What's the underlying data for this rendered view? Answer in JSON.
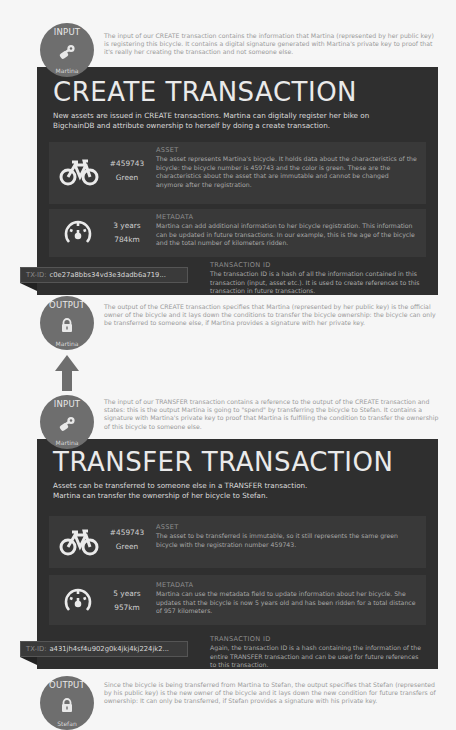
{
  "create": {
    "input": {
      "label": "INPUT",
      "owner": "Martina",
      "icon": "keys-icon",
      "text": "The input of our CREATE transaction contains the information that Martina (represented by her public key) is registering this bicycle. It contains a digital signature generated with Martina's private key to proof that it's really her creating the transaction and not someone else."
    },
    "title": "CREATE TRANSACTION",
    "subtitle": "New assets are issued in CREATE transactions. Martina can digitally register her bike on BigchainDB and attribute ownership to herself by doing a create transaction.",
    "asset": {
      "icon": "bicycle-icon",
      "value1": "#459743",
      "value2": "Green",
      "heading": "ASSET",
      "text": "The asset represents Martina's bicycle. It holds data about the characteristics of the bicycle: the bicycle number is 459743 and the color is green. These are the characteristics about the asset that are immutable and cannot be changed anymore after the registration."
    },
    "metadata": {
      "icon": "speedometer-icon",
      "value1": "3 years",
      "value2": "784km",
      "heading": "METADATA",
      "text": "Martina can add additional information to her bicycle registration. This information can be updated in future transactions. In our example, this is the age of the bicycle and the total number of kilometers ridden."
    },
    "tx": {
      "prefix": "TX-ID:",
      "id": "c0e27a8bbs34vd3e3dadb6a719...",
      "heading": "TRANSACTION ID",
      "text": "The transaction ID is a hash of all the information contained in this transaction (input, asset etc.). It is used to create references to this transaction in future transactions."
    },
    "output": {
      "label": "OUTPUT",
      "owner": "Martina",
      "icon": "lock-icon",
      "text": "The output of the CREATE transaction specifies that Martina (represented by her public key) is the official owner of the bicycle and it lays down the conditions to transfer the bicycle ownership: the bicycle can only be transferred to someone else, if Martina provides a signature with her private key."
    }
  },
  "transfer": {
    "input": {
      "label": "INPUT",
      "owner": "Martina",
      "icon": "keys-icon",
      "text": "The input of our TRANSFER transaction contains a reference to the output of the CREATE transaction and states: this is the output Martina is going to \"spend\" by transferring the bicycle to Stefan. It contains a signature with Martina's private key to proof that Martina is fulfilling the condition to transfer the ownership of this bicycle to someone else."
    },
    "title": "TRANSFER TRANSACTION",
    "subtitle_line1": "Assets can be transferred to someone else in a TRANSFER transaction.",
    "subtitle_line2": "Martina can transfer the ownership of her bicycle to Stefan.",
    "asset": {
      "icon": "bicycle-icon",
      "value1": "#459743",
      "value2": "Green",
      "heading": "ASSET",
      "text": "The asset to be transferred is immutable, so it still represents the same green bicycle with the registration number 459743."
    },
    "metadata": {
      "icon": "speedometer-icon",
      "value1": "5 years",
      "value2": "957km",
      "heading": "METADATA",
      "text": "Martina can use the metadata field to update information about her bicycle. She updates that the bicycle is now 5 years old and has been ridden for a total distance of 957 kilometers."
    },
    "tx": {
      "prefix": "TX-ID:",
      "id": "a431jh4sf4u902g0k4jkj4kj224jk2...",
      "heading": "TRANSACTION ID",
      "text": "Again, the transaction ID is a hash containing the information of the entire TRANSFER transaction and can be used for future references to this transaction."
    },
    "output": {
      "label": "OUTPUT",
      "owner": "Stefan",
      "icon": "lock-icon",
      "text": "Since the bicycle is being transferred from Martina to Stefan, the output specifies that Stefan (represented by his public key) is the new owner of the bicycle and it lays down the new condition for future transfers of ownership: It can only be transferred, if Stefan provides a signature with his private key."
    }
  },
  "connector": {
    "icon": "arrow-up-icon"
  },
  "colors": {
    "panel": "#2f2f2f",
    "row": "#393939",
    "circle": "#6e6e6e",
    "background": "#f6f6f6"
  }
}
